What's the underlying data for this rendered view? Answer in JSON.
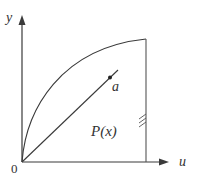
{
  "diagram": {
    "colors": {
      "stroke": "#3a3a3a",
      "text": "#333333",
      "background": "#ffffff"
    },
    "axes": {
      "x_label": "u",
      "y_label": "y",
      "origin_label": "0"
    },
    "labels": {
      "point_label": "a",
      "region_label": "P(x)"
    },
    "elements": {
      "curve": "concave-down arc from origin to top of vertical boundary",
      "ray": "straight line from origin through point a",
      "boundary": "vertical line with hatch marks (wall)"
    }
  }
}
